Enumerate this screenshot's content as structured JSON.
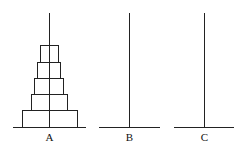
{
  "diagram": {
    "line_color": "#222222",
    "pegs": [
      {
        "label": "A",
        "x": 49,
        "base_x1": 13,
        "base_x2": 86
      },
      {
        "label": "B",
        "x": 129,
        "base_x1": 99,
        "base_x2": 160
      },
      {
        "label": "C",
        "x": 204,
        "base_x1": 174,
        "base_x2": 234
      }
    ],
    "peg_top_y": 13,
    "base_y": 127,
    "label_y": 132,
    "disks_on_A": [
      {
        "x1": 40,
        "x2": 58,
        "y1": 45,
        "y2": 62
      },
      {
        "x1": 37,
        "x2": 60,
        "y1": 62,
        "y2": 78
      },
      {
        "x1": 34,
        "x2": 63,
        "y1": 78,
        "y2": 94
      },
      {
        "x1": 31,
        "x2": 67,
        "y1": 94,
        "y2": 110
      },
      {
        "x1": 22,
        "x2": 77,
        "y1": 110,
        "y2": 127
      }
    ]
  }
}
